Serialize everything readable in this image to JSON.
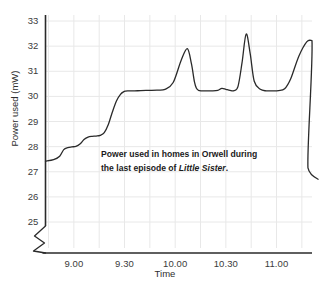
{
  "chart_data": {
    "type": "line",
    "title": "",
    "annotation_line1": "Power used in homes in Orwell during",
    "annotation_line2_pre": "the last episode of ",
    "annotation_line2_italic": "Little Sister",
    "annotation_line2_post": ".",
    "xlabel": "Time",
    "ylabel": "Power used (mW)",
    "xticks": [
      "9.00",
      "9.30",
      "10.00",
      "10.30",
      "11.00"
    ],
    "xtick_values": [
      9.0,
      9.5,
      10.0,
      10.5,
      11.0
    ],
    "yticks": [
      "25",
      "26",
      "27",
      "28",
      "29",
      "30",
      "31",
      "32",
      "33"
    ],
    "ytick_values": [
      25,
      26,
      27,
      28,
      29,
      30,
      31,
      32,
      33
    ],
    "xlim": [
      8.72,
      11.35
    ],
    "ylim": [
      25,
      33
    ],
    "y_axis_break": true,
    "y_axis_break_below": 25,
    "grid": true,
    "grid_color": "#e8e8e8",
    "line_color": "#2a2a2a",
    "line_width": 1.3,
    "legend": "none",
    "x": [
      8.72,
      8.8,
      8.86,
      8.9,
      8.94,
      8.98,
      9.02,
      9.06,
      9.1,
      9.14,
      9.18,
      9.22,
      9.26,
      9.3,
      9.34,
      9.38,
      9.42,
      9.46,
      9.49,
      9.51,
      9.53,
      9.56,
      9.6,
      9.66,
      9.74,
      9.82,
      9.9,
      9.98,
      10.06,
      10.12,
      10.16,
      10.19,
      10.21,
      10.23,
      10.26,
      10.3,
      10.36,
      10.42,
      10.46,
      10.5,
      10.54,
      10.58,
      10.62,
      10.66,
      10.7,
      10.74,
      10.78,
      10.84,
      10.9,
      10.96,
      11.02,
      11.08,
      11.14,
      11.22,
      11.3,
      11.35
    ],
    "y": [
      27.42,
      27.48,
      27.62,
      27.88,
      27.96,
      27.99,
      28.01,
      28.1,
      28.28,
      28.38,
      28.41,
      28.42,
      28.45,
      28.56,
      28.88,
      29.38,
      29.82,
      30.08,
      30.18,
      30.21,
      30.22,
      30.22,
      30.22,
      30.23,
      30.24,
      30.25,
      30.28,
      30.55,
      31.45,
      31.9,
      31.3,
      30.58,
      30.32,
      30.24,
      30.22,
      30.22,
      30.22,
      30.24,
      30.32,
      30.28,
      30.24,
      30.23,
      30.4,
      31.35,
      32.48,
      31.7,
      30.6,
      30.28,
      30.22,
      30.22,
      30.23,
      30.3,
      30.7,
      31.6,
      32.18,
      32.22
    ],
    "series_note": "continuous power trace",
    "peaks": [
      {
        "time": "9.52",
        "value": 31.9
      },
      {
        "time": "10.22",
        "value": 32.5
      },
      {
        "time": "10.50",
        "value": 32.2
      }
    ],
    "start_value": 27.42,
    "end_value": 26.7
  }
}
